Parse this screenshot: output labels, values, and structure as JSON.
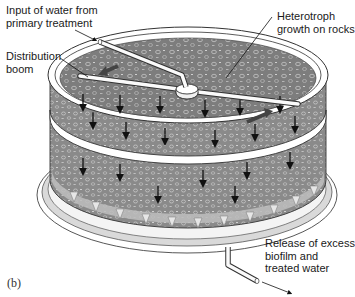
{
  "figure": {
    "panel_label": "(b)",
    "colors": {
      "rock_bed": "#7a7a7a",
      "rock_bed_light": "#9a9a9a",
      "rim": "#ffffff",
      "outline": "#333333",
      "arrow": "#111111",
      "biofilm_runoff": "#c8c8c8"
    }
  },
  "labels": {
    "input": "Input of water from\nprimary treatment",
    "boom": "Distribution\nboom",
    "heterotroph": "Heterotroph\ngrowth on rocks",
    "release": "Release of excess\nbiofilm and\ntreated water"
  }
}
